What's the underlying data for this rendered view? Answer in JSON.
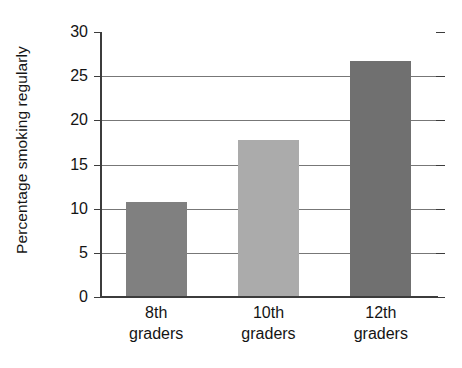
{
  "chart_data": {
    "type": "bar",
    "title": "",
    "xlabel": "",
    "ylabel": "Percentage smoking regularly",
    "categories": [
      "8th graders",
      "10th graders",
      "12th graders"
    ],
    "category_lines": [
      [
        "8th",
        "graders"
      ],
      [
        "10th",
        "graders"
      ],
      [
        "12th",
        "graders"
      ]
    ],
    "values": [
      10.8,
      17.8,
      26.7
    ],
    "bar_colors": [
      "#808080",
      "#ababab",
      "#707070"
    ],
    "ylim": [
      0,
      30
    ],
    "ytick_values": [
      0,
      5,
      10,
      15,
      20,
      25,
      30
    ],
    "ytick_labels": [
      "0",
      "5",
      "10",
      "15",
      "20",
      "25",
      "30"
    ],
    "grid": true,
    "legend": "none"
  }
}
